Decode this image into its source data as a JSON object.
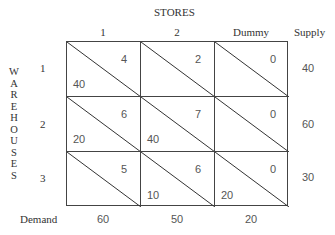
{
  "title": "STORES",
  "row_axis_label": [
    "W",
    "A",
    "R",
    "E",
    "H",
    "O",
    "U",
    "S",
    "E",
    "S"
  ],
  "columns": [
    "1",
    "2",
    "Dummy"
  ],
  "supply_header": "Supply",
  "demand_label": "Demand",
  "rows": [
    {
      "label": "1",
      "supply": "40",
      "cells": [
        {
          "cost": "4",
          "allocation": "40"
        },
        {
          "cost": "2",
          "allocation": ""
        },
        {
          "cost": "0",
          "allocation": ""
        }
      ]
    },
    {
      "label": "2",
      "supply": "60",
      "cells": [
        {
          "cost": "6",
          "allocation": "20"
        },
        {
          "cost": "7",
          "allocation": "40"
        },
        {
          "cost": "0",
          "allocation": ""
        }
      ]
    },
    {
      "label": "3",
      "supply": "30",
      "cells": [
        {
          "cost": "5",
          "allocation": ""
        },
        {
          "cost": "6",
          "allocation": "10"
        },
        {
          "cost": "0",
          "allocation": "20"
        }
      ]
    }
  ],
  "demand": [
    "60",
    "50",
    "20"
  ]
}
